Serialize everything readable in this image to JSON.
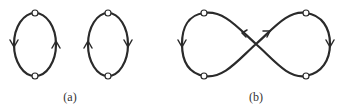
{
  "figure": {
    "panels": [
      {
        "id": "a",
        "label": "(a)",
        "description": "Two separate oriented closed loops, each with two vertices (top and bottom)",
        "loops": [
          {
            "name": "left-loop",
            "direction_left_side": "down",
            "direction_right_side": "up",
            "vertices": 2
          },
          {
            "name": "right-loop",
            "direction_left_side": "up",
            "direction_right_side": "down",
            "vertices": 2
          }
        ]
      },
      {
        "id": "b",
        "label": "(b)",
        "description": "Single figure-eight closed curve with four vertices and a central crossing",
        "vertices": 4,
        "arrows": [
          "left-side down",
          "center upper-left",
          "center upper-right",
          "right-side down"
        ]
      }
    ],
    "colors": {
      "stroke": "#2a2a2a",
      "node_fill": "#ffffff",
      "background": "#ffffff"
    }
  }
}
